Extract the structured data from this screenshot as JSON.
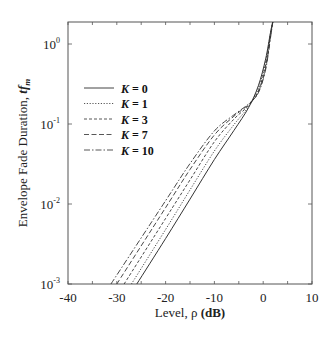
{
  "chart_data": {
    "type": "line",
    "title": "",
    "xlabel": "Level, ρ (dB)",
    "xlabel_plain": "Level, ρ ",
    "xlabel_bold": "(dB)",
    "ylabel": "Envelope Fade Duration, tf_m",
    "ylabel_plain": "Envelope Fade Duration, ",
    "ylabel_bold": "tf",
    "ylabel_sub": "m",
    "xlim": [
      -40,
      10
    ],
    "ylim": [
      0.001,
      1.95
    ],
    "yscale": "log",
    "grid": false,
    "legend_position": "upper left (inside)",
    "x_ticks": [
      -40,
      -30,
      -20,
      -10,
      0,
      10
    ],
    "x_tick_labels": [
      "-40",
      "-30",
      "-20",
      "-10",
      "0",
      "10"
    ],
    "y_ticks": [
      0.001,
      0.01,
      0.1,
      1
    ],
    "y_tick_labels": [
      {
        "base": "10",
        "exp": "-3"
      },
      {
        "base": "10",
        "exp": "-2"
      },
      {
        "base": "10",
        "exp": "-1"
      },
      {
        "base": "10",
        "exp": "0"
      }
    ],
    "series": [
      {
        "name": "K = 0",
        "k": "K",
        "eq": " = 0",
        "dash": "",
        "width": 1.0,
        "x": [
          -25.9,
          -20,
          -15,
          -10,
          -6,
          -3,
          -1,
          0.5,
          1.5,
          2.0
        ],
        "y": [
          0.001,
          0.0037,
          0.0115,
          0.036,
          0.083,
          0.16,
          0.3,
          0.65,
          1.4,
          1.95
        ]
      },
      {
        "name": "K = 1",
        "k": "K",
        "eq": " = 1",
        "dash": "1.2,1.6",
        "width": 0.9,
        "x": [
          -27.0,
          -20,
          -15,
          -10,
          -6,
          -3,
          -1,
          0.5,
          1.5,
          2.0
        ],
        "y": [
          0.001,
          0.0048,
          0.015,
          0.046,
          0.098,
          0.165,
          0.28,
          0.6,
          1.35,
          1.95
        ]
      },
      {
        "name": "K = 3",
        "k": "K",
        "eq": " = 3",
        "dash": "3,2",
        "width": 0.9,
        "x": [
          -28.5,
          -20,
          -15,
          -10,
          -6,
          -3,
          -1,
          0.5,
          1.5,
          2.0
        ],
        "y": [
          0.001,
          0.0066,
          0.02,
          0.06,
          0.115,
          0.17,
          0.26,
          0.55,
          1.3,
          1.95
        ]
      },
      {
        "name": "K = 7",
        "k": "K",
        "eq": " = 7",
        "dash": "5,2.5",
        "width": 0.9,
        "x": [
          -30.0,
          -20,
          -15,
          -10,
          -6,
          -3,
          -1,
          0.5,
          1.5,
          2.0
        ],
        "y": [
          0.001,
          0.009,
          0.027,
          0.073,
          0.125,
          0.175,
          0.25,
          0.5,
          1.25,
          1.95
        ]
      },
      {
        "name": "K = 10",
        "k": "K",
        "eq": " = 10",
        "dash": "6,2,1.5,2",
        "width": 0.9,
        "x": [
          -31.2,
          -20,
          -15,
          -10,
          -6,
          -3,
          -1,
          0.5,
          1.5,
          2.0
        ],
        "y": [
          0.001,
          0.011,
          0.032,
          0.082,
          0.13,
          0.178,
          0.245,
          0.48,
          1.2,
          1.95
        ]
      }
    ]
  }
}
